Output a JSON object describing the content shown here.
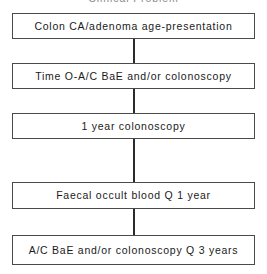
{
  "figure": {
    "caption": "Clinical Problem",
    "caption_visible": "partially cut off at top edge",
    "type": "vertical-flowchart",
    "box_border_color": "#4a4a4a",
    "connector_color": "#2b2b2b",
    "background_color": "#ffffff",
    "text_color": "#1a1a1a"
  },
  "nodes": [
    {
      "id": "node-1",
      "label": "Colon CA/adenoma age-presentation"
    },
    {
      "id": "node-2",
      "label": "Time O-A/C BaE and/or colonoscopy"
    },
    {
      "id": "node-3",
      "label": "1 year colonoscopy"
    },
    {
      "id": "node-4",
      "label": "Faecal occult blood Q 1 year"
    },
    {
      "id": "node-5",
      "label": "A/C BaE and/or colonoscopy Q 3 years"
    }
  ],
  "connectors": [
    {
      "id": "connector-1",
      "from": "node-1",
      "to": "node-2"
    },
    {
      "id": "connector-2",
      "from": "node-2",
      "to": "node-3"
    },
    {
      "id": "connector-3",
      "from": "node-3",
      "to": "node-4"
    },
    {
      "id": "connector-4",
      "from": "node-4",
      "to": "node-5"
    }
  ]
}
